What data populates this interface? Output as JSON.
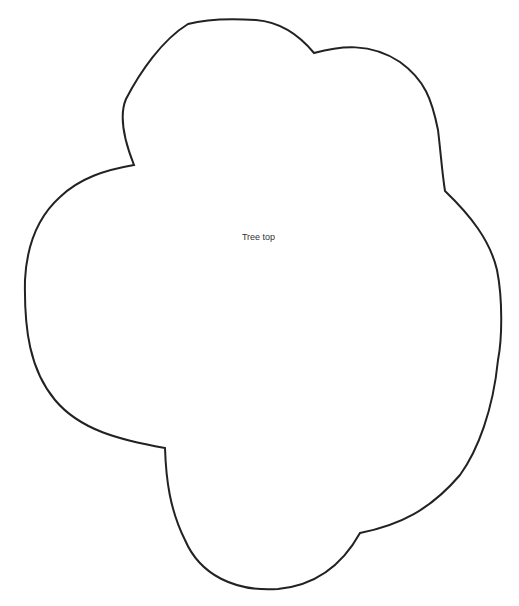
{
  "shape": {
    "label": "Tree top",
    "stroke_color": "#222222",
    "fill_color": "#ffffff"
  }
}
